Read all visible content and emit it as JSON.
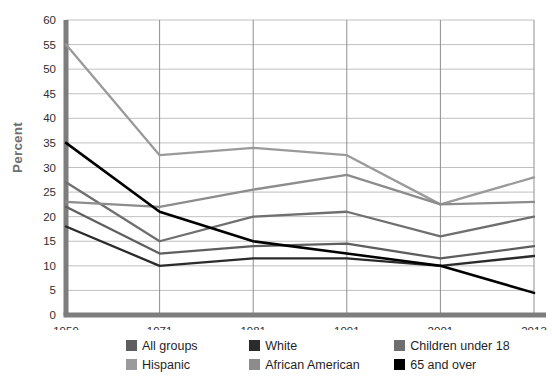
{
  "chart_data": {
    "type": "line",
    "title": "",
    "xlabel": "",
    "ylabel": "Percent",
    "categories": [
      "1959",
      "1971",
      "1981",
      "1991",
      "2001",
      "2013"
    ],
    "x_tick_labels": [
      "1959",
      "1971",
      "1981",
      "1991",
      "2001",
      "2013"
    ],
    "y_tick_labels": [
      "0",
      "5",
      "10",
      "15",
      "20",
      "25",
      "30",
      "35",
      "40",
      "45",
      "50",
      "55",
      "60"
    ],
    "ylim": [
      0,
      60
    ],
    "ytick_step": 5,
    "grid": true,
    "legend_position": "bottom",
    "series": [
      {
        "name": "All groups",
        "color": "#5e5e5e",
        "values": [
          22,
          12.5,
          14,
          14.5,
          11.5,
          14
        ]
      },
      {
        "name": "White",
        "color": "#2b2b2b",
        "values": [
          18,
          10,
          11.5,
          11.5,
          10,
          12
        ]
      },
      {
        "name": "Children under 18",
        "color": "#6f6f6f",
        "values": [
          27,
          15,
          20,
          21,
          16,
          20
        ]
      },
      {
        "name": "Hispanic",
        "color": "#9a9a9a",
        "values": [
          55,
          32.5,
          34,
          32.5,
          22.5,
          28
        ]
      },
      {
        "name": "African American",
        "color": "#8c8c8c",
        "values": [
          23,
          22,
          25.5,
          28.5,
          22.5,
          23
        ]
      },
      {
        "name": "65 and over",
        "color": "#000000",
        "values": [
          35,
          21,
          15,
          12.5,
          10,
          4.5
        ]
      }
    ]
  },
  "axis": {
    "y_title": "Percent"
  },
  "legend": {
    "rows": [
      [
        {
          "label": "All groups",
          "color": "#5e5e5e"
        },
        {
          "label": "White",
          "color": "#2b2b2b"
        },
        {
          "label": "Children under 18",
          "color": "#6f6f6f"
        }
      ],
      [
        {
          "label": "Hispanic",
          "color": "#9a9a9a"
        },
        {
          "label": "African American",
          "color": "#8c8c8c"
        },
        {
          "label": "65 and over",
          "color": "#000000"
        }
      ]
    ]
  },
  "footnote": {
    "text": ""
  }
}
